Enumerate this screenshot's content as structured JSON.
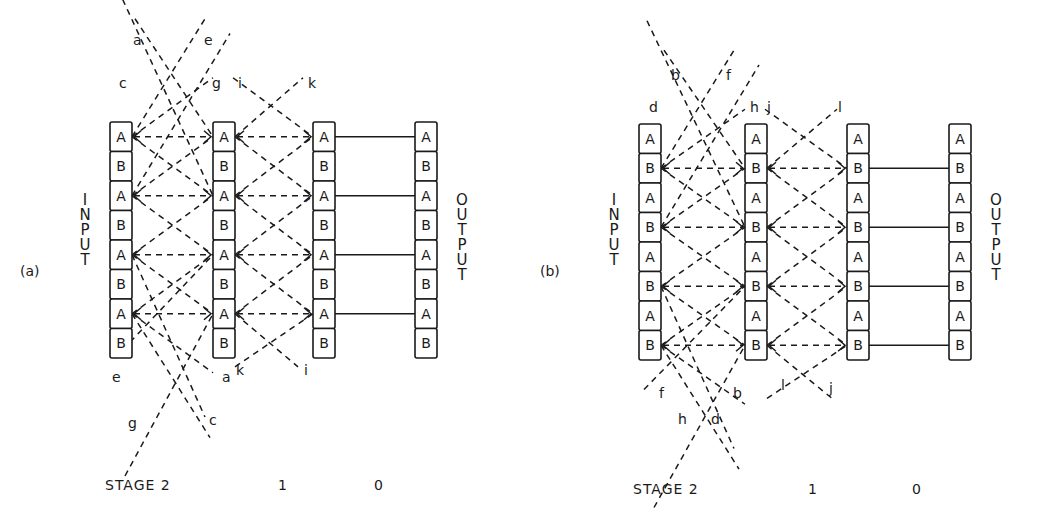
{
  "panels": [
    {
      "id": "a",
      "tag": "(a)",
      "input_label": "INPUT",
      "output_label": "OUTPUT",
      "columns_x": [
        110,
        213,
        313,
        415
      ],
      "top_y": 122,
      "cells": [
        "A",
        "B",
        "A",
        "B",
        "A",
        "B",
        "A",
        "B"
      ],
      "dashed_rows": [
        0,
        2,
        4,
        6
      ],
      "solid_rows": [
        0,
        2,
        4,
        6
      ],
      "stage_labels": {
        "stage": "STAGE 2",
        "s1": "1",
        "s0": "0"
      },
      "stage_x": [
        105,
        278,
        378
      ],
      "wire_labels": [
        {
          "t": "a",
          "x": 133,
          "y": 45
        },
        {
          "t": "e",
          "x": 204,
          "y": 45
        },
        {
          "t": "c",
          "x": 119,
          "y": 88
        },
        {
          "t": "g",
          "x": 212,
          "y": 88
        },
        {
          "t": "i",
          "x": 238,
          "y": 88
        },
        {
          "t": "k",
          "x": 308,
          "y": 88
        },
        {
          "t": "e",
          "x": 112,
          "y": 382
        },
        {
          "t": "a",
          "x": 222,
          "y": 382
        },
        {
          "t": "k",
          "x": 236,
          "y": 375
        },
        {
          "t": "i",
          "x": 304,
          "y": 375
        },
        {
          "t": "g",
          "x": 128,
          "y": 428
        },
        {
          "t": "c",
          "x": 209,
          "y": 425
        }
      ]
    },
    {
      "id": "b",
      "tag": "(b)",
      "input_label": "INPUT",
      "output_label": "OUTPUT",
      "columns_x": [
        639,
        745,
        847,
        949
      ],
      "top_y": 124,
      "cells": [
        "A",
        "B",
        "A",
        "B",
        "A",
        "B",
        "A",
        "B"
      ],
      "dashed_rows": [
        1,
        3,
        5,
        7
      ],
      "solid_rows": [
        1,
        3,
        5,
        7
      ],
      "stage_labels": {
        "stage": "STAGE 2",
        "s1": "1",
        "s0": "0"
      },
      "stage_x": [
        631,
        808,
        914
      ],
      "wire_labels": [
        {
          "t": "b",
          "x": 671,
          "y": 80
        },
        {
          "t": "f",
          "x": 726,
          "y": 80
        },
        {
          "t": "d",
          "x": 649,
          "y": 112
        },
        {
          "t": "h",
          "x": 750,
          "y": 112
        },
        {
          "t": "j",
          "x": 767,
          "y": 112
        },
        {
          "t": "l",
          "x": 838,
          "y": 112
        },
        {
          "t": "f",
          "x": 659,
          "y": 398
        },
        {
          "t": "b",
          "x": 733,
          "y": 398
        },
        {
          "t": "l",
          "x": 781,
          "y": 390
        },
        {
          "t": "j",
          "x": 829,
          "y": 393
        },
        {
          "t": "h",
          "x": 678,
          "y": 424
        },
        {
          "t": "d",
          "x": 711,
          "y": 424
        }
      ]
    }
  ],
  "colors": {
    "ink": "#1a1a1a",
    "background": "#ffffff"
  }
}
